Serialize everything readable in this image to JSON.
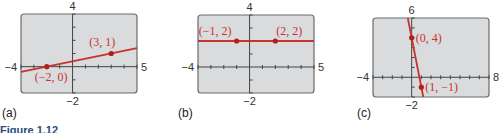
{
  "figure_caption": "Figure 1.12",
  "colors": {
    "screen_bg": "#dadbdd",
    "frame": "#6b6b6b",
    "axis": "#444444",
    "line": "#c8332f",
    "point": "#b0201c",
    "label": "#c8332f"
  },
  "chart_data": [
    {
      "type": "line",
      "panel_label": "(a)",
      "window": {
        "xmin": -4,
        "xmax": 5,
        "ymin": -2,
        "ymax": 4
      },
      "tick_labels": {
        "left": "−4",
        "right": "5",
        "top": "4",
        "bottom": "−2"
      },
      "grid": false,
      "points": [
        {
          "x": -2,
          "y": 0,
          "label": "(−2, 0)"
        },
        {
          "x": 3,
          "y": 1,
          "label": "(3, 1)"
        }
      ],
      "line": {
        "slope": 0.2,
        "intercept": 0.4
      }
    },
    {
      "type": "line",
      "panel_label": "(b)",
      "window": {
        "xmin": -4,
        "xmax": 5,
        "ymin": -2,
        "ymax": 4
      },
      "tick_labels": {
        "left": "−4",
        "right": "5",
        "top": "4",
        "bottom": "−2"
      },
      "grid": false,
      "points": [
        {
          "x": -1,
          "y": 2,
          "label": "(−1, 2)"
        },
        {
          "x": 2,
          "y": 2,
          "label": "(2, 2)"
        }
      ],
      "line": {
        "slope": 0,
        "intercept": 2
      }
    },
    {
      "type": "line",
      "panel_label": "(c)",
      "window": {
        "xmin": -4,
        "xmax": 8,
        "ymin": -2,
        "ymax": 6
      },
      "tick_labels": {
        "left": "−4",
        "right": "8",
        "top": "6",
        "bottom": "−2"
      },
      "grid": false,
      "points": [
        {
          "x": 0,
          "y": 4,
          "label": "(0, 4)"
        },
        {
          "x": 1,
          "y": -1,
          "label": "(1, −1)"
        }
      ],
      "line": {
        "slope": -5,
        "intercept": 4
      }
    }
  ]
}
